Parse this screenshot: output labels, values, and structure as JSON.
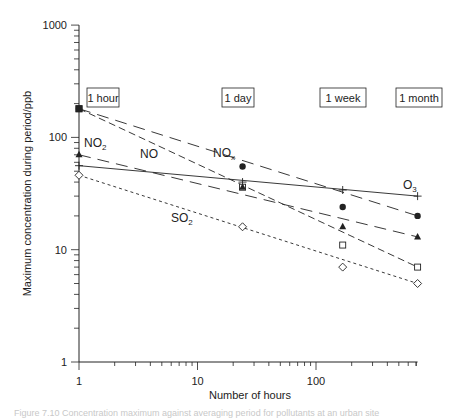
{
  "chart_data": {
    "type": "line",
    "title": "",
    "xlabel": "Number of hours",
    "ylabel": "Maximum concentration during period/ppb",
    "xscale": "log",
    "yscale": "log",
    "xlim": [
      1,
      720
    ],
    "ylim": [
      1,
      1000
    ],
    "x_ticks": [
      "1",
      "10",
      "100"
    ],
    "y_ticks": [
      "1",
      "10",
      "100",
      "1000"
    ],
    "grid": false,
    "x": [
      1,
      24,
      168,
      720
    ],
    "period_labels": [
      {
        "label": "1 hour",
        "x": 1
      },
      {
        "label": "1 day",
        "x": 24
      },
      {
        "label": "1 week",
        "x": 168
      },
      {
        "label": "1 month",
        "x": 720
      }
    ],
    "series": [
      {
        "name": "NOx",
        "label_main": "NO",
        "label_sub": "x",
        "marker": "filled-circle",
        "line": "long-dash",
        "values": [
          180,
          55,
          24,
          20
        ]
      },
      {
        "name": "NO",
        "label_main": "NO",
        "label_sub": "",
        "marker": "open-square",
        "line": "medium-dash",
        "values": [
          180,
          36,
          11,
          7
        ]
      },
      {
        "name": "NO2",
        "label_main": "NO",
        "label_sub": "2",
        "marker": "filled-triangle",
        "line": "long-dash",
        "values": [
          70,
          36,
          16,
          13
        ]
      },
      {
        "name": "O3",
        "label_main": "O",
        "label_sub": "3",
        "marker": "plus",
        "line": "solid",
        "values": [
          56,
          40,
          34,
          30
        ]
      },
      {
        "name": "SO2",
        "label_main": "SO",
        "label_sub": "2",
        "marker": "open-diamond",
        "line": "short-dash",
        "values": [
          46,
          16,
          7,
          5
        ]
      }
    ]
  },
  "caption": "Figure 7.10 Concentration maximum against averaging period for pollutants at an urban site"
}
